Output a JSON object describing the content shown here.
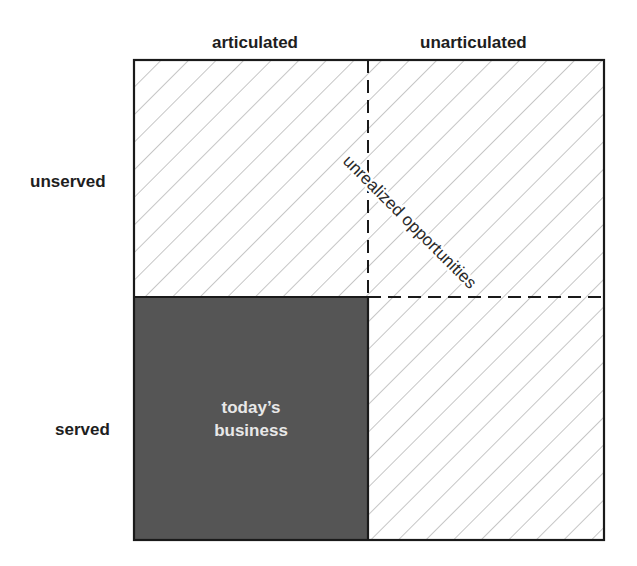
{
  "diagram": {
    "type": "2x2 matrix",
    "columns": [
      {
        "label": "articulated"
      },
      {
        "label": "unarticulated"
      }
    ],
    "rows": [
      {
        "label": "unserved"
      },
      {
        "label": "served"
      }
    ],
    "quadrants": {
      "served_articulated": {
        "label_line1": "today’s",
        "label_line2": "business",
        "fill": "#555555"
      },
      "other_quadrants_fill": "hatched"
    },
    "diagonal_label": "unrealized opportunities",
    "colors": {
      "border": "#1a1a1a",
      "hatch": "#b5b5b5",
      "dark_fill": "#555555",
      "dark_text": "#e8e8e8"
    }
  }
}
